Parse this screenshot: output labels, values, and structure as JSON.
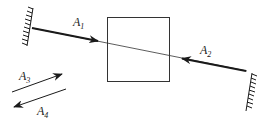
{
  "diagram": {
    "labels": {
      "a1": {
        "main": "A",
        "sub": "1"
      },
      "a2": {
        "main": "A",
        "sub": "2"
      },
      "a3": {
        "main": "A",
        "sub": "3"
      },
      "a4": {
        "main": "A",
        "sub": "4"
      }
    },
    "colors": {
      "stroke": "#1a1a1a",
      "background": "#ffffff"
    }
  }
}
